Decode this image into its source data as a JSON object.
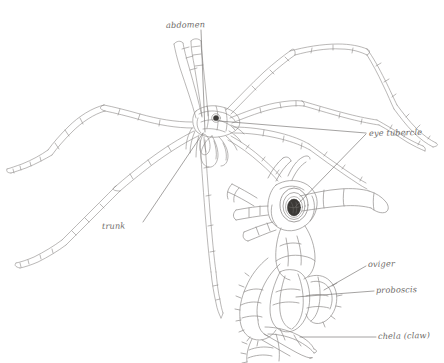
{
  "figure": {
    "background_color": "#ffffff",
    "ink_color": "#8b8886",
    "dark_ink_color": "#55524f",
    "label_color": "#6d6a68"
  },
  "labels": {
    "abdomen": "abdomen",
    "eye_tubercle": "eye tubercle",
    "trunk": "trunk",
    "oviger": "oviger",
    "proboscis": "proboscis",
    "chela": "chela (claw)"
  }
}
